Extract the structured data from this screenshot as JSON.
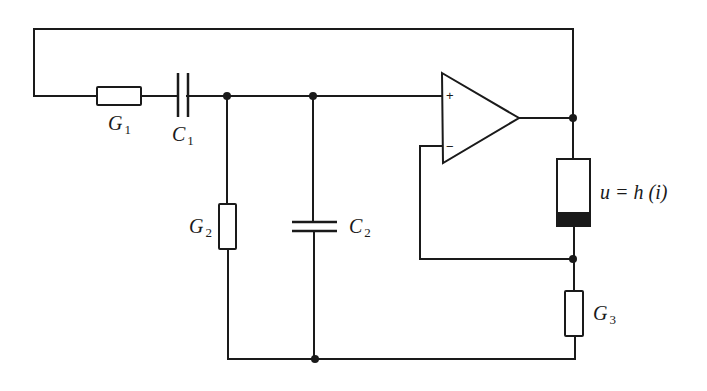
{
  "diagram": {
    "type": "circuit",
    "components": {
      "G1": {
        "label": "G",
        "sub": "1",
        "kind": "resistor"
      },
      "C1": {
        "label": "C",
        "sub": "1",
        "kind": "capacitor"
      },
      "G2": {
        "label": "G",
        "sub": "2",
        "kind": "resistor"
      },
      "C2": {
        "label": "C",
        "sub": "2",
        "kind": "capacitor"
      },
      "G3": {
        "label": "G",
        "sub": "3",
        "kind": "resistor"
      },
      "nonlinear": {
        "label": "u = h (i)",
        "kind": "nonlinear-resistor"
      },
      "opamp": {
        "plus": "+",
        "minus": "−",
        "kind": "operational-amplifier"
      }
    },
    "colors": {
      "ink": "#1a1a1a",
      "background": "#ffffff"
    }
  }
}
